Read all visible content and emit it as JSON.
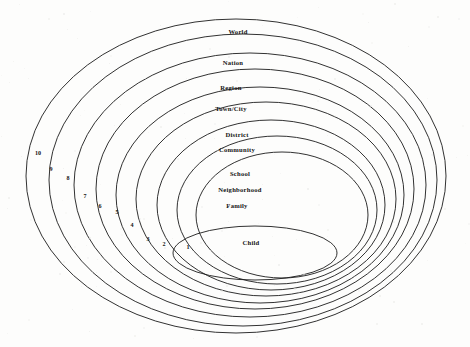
{
  "figure": {
    "kind": "concentric-ellipses-diagram",
    "background_color": "#fdfdfc",
    "stroke_color": "#1b1b1b",
    "text_color": "#141414",
    "ring_count": 10
  },
  "rings": [
    {
      "number": "10",
      "label": "World",
      "number_x": 38,
      "number_y": 155,
      "label_x": 238,
      "label_y": 34,
      "cx": 236,
      "cy": 176,
      "rx": 210,
      "ry": 157
    },
    {
      "number": "9",
      "label": "Nation",
      "number_x": 51,
      "number_y": 171,
      "label_x": 233,
      "label_y": 65,
      "cx": 243,
      "cy": 180,
      "rx": 194,
      "ry": 146
    },
    {
      "number": "8",
      "label": "Region",
      "number_x": 68,
      "number_y": 180,
      "label_x": 231,
      "label_y": 90,
      "cx": 250,
      "cy": 185,
      "rx": 176,
      "ry": 132
    },
    {
      "number": "7",
      "label": "Town/City",
      "number_x": 85,
      "number_y": 198,
      "label_x": 231,
      "label_y": 111,
      "cx": 255,
      "cy": 189,
      "rx": 159,
      "ry": 120
    },
    {
      "number": "6",
      "label": "District",
      "number_x": 100,
      "number_y": 208,
      "label_x": 237,
      "label_y": 137,
      "cx": 260,
      "cy": 195,
      "rx": 144,
      "ry": 108
    },
    {
      "number": "5",
      "label": "Community",
      "number_x": 117,
      "number_y": 214,
      "label_x": 237,
      "label_y": 152,
      "cx": 266,
      "cy": 199,
      "rx": 130,
      "ry": 97
    },
    {
      "number": "4",
      "label": "School",
      "number_x": 132,
      "number_y": 227,
      "label_x": 240,
      "label_y": 176,
      "cx": 271,
      "cy": 205,
      "rx": 114,
      "ry": 85
    },
    {
      "number": "3",
      "label": "Neighborhood",
      "number_x": 148,
      "number_y": 241,
      "label_x": 240,
      "label_y": 192,
      "cx": 277,
      "cy": 210,
      "rx": 100,
      "ry": 74
    },
    {
      "number": "2",
      "label": "Family",
      "number_x": 164,
      "number_y": 246,
      "label_x": 237,
      "label_y": 208,
      "cx": 282,
      "cy": 215,
      "rx": 86,
      "ry": 63
    },
    {
      "number": "1",
      "label": "Child",
      "number_x": 188,
      "number_y": 249,
      "label_x": 251,
      "label_y": 245,
      "cx": 255,
      "cy": 253,
      "rx": 82,
      "ry": 27
    }
  ]
}
